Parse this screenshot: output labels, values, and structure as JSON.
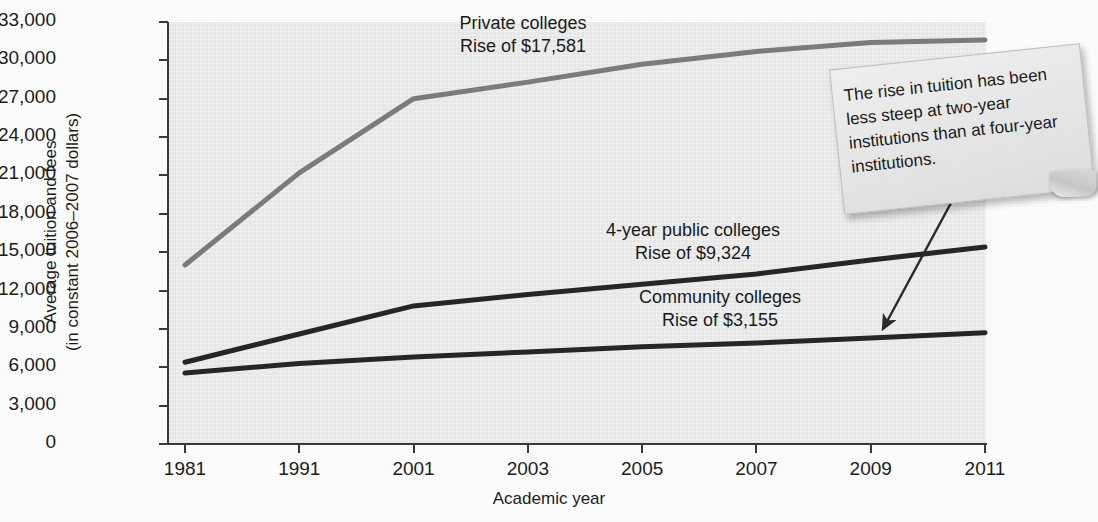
{
  "chart_data": {
    "type": "line",
    "title": "",
    "xlabel": "Academic year",
    "ylabel_line1": "Average tuition and fees",
    "ylabel_line2": "(in constant 2006–2007 dollars)",
    "categories": [
      "1981",
      "1991",
      "2001",
      "2003",
      "2005",
      "2007",
      "2009",
      "2011"
    ],
    "ylim": [
      0,
      33000
    ],
    "yticks": [
      "0",
      "3,000",
      "6,000",
      "9,000",
      "12,000",
      "15,000",
      "18,000",
      "21,000",
      "24,000",
      "27,000",
      "30,000",
      "33,000"
    ],
    "ytick_values": [
      0,
      3000,
      6000,
      9000,
      12000,
      15000,
      18000,
      21000,
      24000,
      27000,
      30000,
      33000
    ],
    "grid": false,
    "legend_position": "inline-annotations",
    "series": [
      {
        "name": "Private colleges",
        "color": "#7b7b7b",
        "values": [
          14000,
          21200,
          27000,
          28300,
          29700,
          30700,
          31400,
          31600
        ]
      },
      {
        "name": "4-year public colleges",
        "color": "#262626",
        "values": [
          6400,
          8600,
          10800,
          11700,
          12500,
          13300,
          14400,
          15400
        ]
      },
      {
        "name": "Community colleges",
        "color": "#262626",
        "values": [
          5550,
          6300,
          6800,
          7200,
          7600,
          7900,
          8300,
          8700
        ]
      }
    ]
  },
  "annotations": {
    "private": {
      "line1": "Private colleges",
      "line2": "Rise of $17,581"
    },
    "public4": {
      "line1": "4-year public colleges",
      "line2": "Rise of $9,324"
    },
    "community": {
      "line1": "Community colleges",
      "line2": "Rise of $3,155"
    }
  },
  "callout": {
    "text": "The rise in tuition has been less steep at two-year institutions than at four-year institutions."
  },
  "watermark": {
    "text": ""
  },
  "colors": {
    "plot_background": "#e7e7e7",
    "page_background": "#fdfdfd",
    "axis": "#3a3a3a",
    "private_series": "#7b7b7b",
    "dark_series": "#262626",
    "callout_background": "#e9e9e9",
    "arrow": "#2b2b2b"
  }
}
